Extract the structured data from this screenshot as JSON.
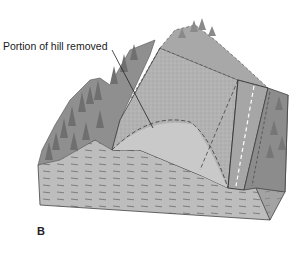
{
  "diagram": {
    "type": "geologic block diagram",
    "callouts": [
      {
        "text": "Portion of hill removed",
        "points_to": "dashed outline of removed hill section"
      }
    ],
    "panel_label": "B",
    "elements": [
      {
        "name": "forested-hill-left",
        "fill": "#8f8f8f"
      },
      {
        "name": "hill-removed-region",
        "fill": "#b8b8b8"
      },
      {
        "name": "road",
        "fill": "#a9a9a9",
        "center_line": "dashed white"
      },
      {
        "name": "forested-slope-right",
        "fill": "#8c8c8c"
      },
      {
        "name": "block-front-face",
        "fill": "#bdbdbd",
        "pattern": "dashed strata"
      },
      {
        "name": "block-right-face",
        "fill": "#9e9e9e"
      }
    ],
    "colors": {
      "outline": "#333333",
      "tree": "#7a7a7a",
      "sky": "#ffffff"
    }
  }
}
